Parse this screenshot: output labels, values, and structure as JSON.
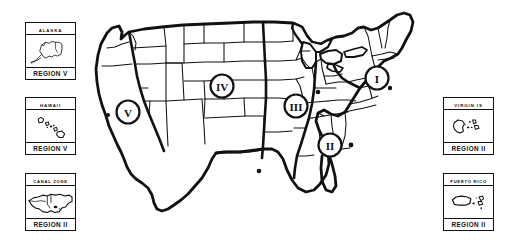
{
  "figure": {
    "type": "map",
    "background_color": "#ffffff",
    "line_color": "#111111"
  },
  "main_map": {
    "name": "united-states-contiguous",
    "region_markers": [
      {
        "label": "I",
        "x": 377,
        "y": 78,
        "name": "region-marker-i"
      },
      {
        "label": "II",
        "x": 330,
        "y": 145,
        "name": "region-marker-ii"
      },
      {
        "label": "III",
        "x": 296,
        "y": 106,
        "name": "region-marker-iii"
      },
      {
        "label": "IV",
        "x": 222,
        "y": 86,
        "name": "region-marker-iv"
      },
      {
        "label": "V",
        "x": 128,
        "y": 112,
        "name": "region-marker-v"
      }
    ],
    "city_dots": [
      {
        "x": 259,
        "y": 171
      },
      {
        "x": 259,
        "y": 119
      },
      {
        "x": 351,
        "y": 145
      },
      {
        "x": 390,
        "y": 88
      },
      {
        "x": 317,
        "y": 75
      },
      {
        "x": 108,
        "y": 115
      }
    ]
  },
  "insets": [
    {
      "id": "alaska",
      "title": "ALASKA",
      "region": "REGION V",
      "shape": "alaska-outline"
    },
    {
      "id": "hawaii",
      "title": "HAWAII",
      "region": "REGION V",
      "shape": "hawaii-islands"
    },
    {
      "id": "canal-zone",
      "title": "CANAL ZONE",
      "region": "REGION II",
      "shape": "canal-zone-outline"
    },
    {
      "id": "virgin-islands",
      "title": "VIRGIN IS",
      "region": "REGION II",
      "shape": "virgin-islands"
    },
    {
      "id": "puerto-rico",
      "title": "PUERTO RICO",
      "region": "REGION II",
      "shape": "puerto-rico-islands"
    }
  ]
}
